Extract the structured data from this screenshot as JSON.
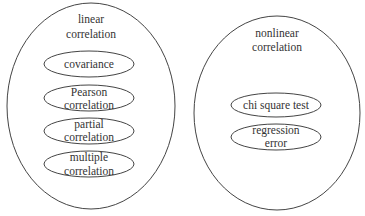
{
  "diagram": {
    "groups": [
      {
        "id": "linear",
        "title_lines": [
          "linear",
          "correlation"
        ],
        "items": [
          {
            "lines": [
              "covariance"
            ]
          },
          {
            "lines": [
              "Pearson",
              "correlation"
            ]
          },
          {
            "lines": [
              "partial",
              "correlation"
            ]
          },
          {
            "lines": [
              "multiple",
              "correlation"
            ]
          }
        ]
      },
      {
        "id": "nonlinear",
        "title_lines": [
          "nonlinear",
          "correlation"
        ],
        "items": [
          {
            "lines": [
              "chi square test"
            ]
          },
          {
            "lines": [
              "regression",
              "error"
            ]
          }
        ]
      }
    ],
    "colors": {
      "stroke": "#444444",
      "text": "#333333",
      "background": "#ffffff"
    }
  }
}
